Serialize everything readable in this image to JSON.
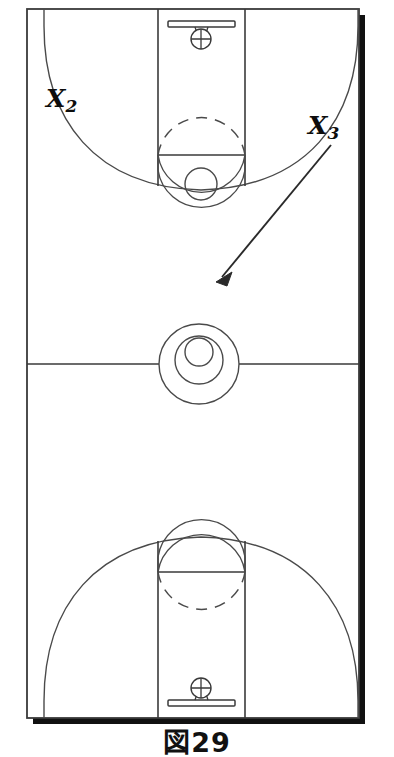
{
  "figure": {
    "caption": "図29",
    "background_color": "#ffffff",
    "line_color": "#3a3a3a",
    "shadow_color": "#111111",
    "label_color": "#0d0d0d"
  },
  "court": {
    "orientation": "vertical-full-court",
    "left": 27,
    "top": 9,
    "right": 359,
    "bottom": 718,
    "midline_y": 364,
    "shadow_offset": 6
  },
  "players": [
    {
      "id": "x2",
      "symbol": "X",
      "subscript": "2",
      "label": "X2",
      "x": 59,
      "y": 100,
      "role": "offensive-player-wing-left"
    },
    {
      "id": "x3",
      "symbol": "X",
      "subscript": "3",
      "label": "X3",
      "x": 320,
      "y": 128,
      "role": "offensive-player-wing-right"
    }
  ],
  "movements": [
    {
      "id": "cut-x3",
      "from_player": "X3",
      "type": "cut-arrow-straight",
      "start_x": 330,
      "start_y": 144,
      "end_x": 216,
      "end_y": 281,
      "description": "X3 cuts toward the middle of the court"
    }
  ],
  "baskets": [
    {
      "id": "top-basket",
      "position": "top",
      "backboard_y": 24,
      "rim_y": 37
    },
    {
      "id": "bottom-basket",
      "position": "bottom",
      "backboard_y": 703,
      "rim_y": 690
    }
  ],
  "center_circle": {
    "cx": 199,
    "cy": 364,
    "outer_r": 40,
    "middle_r": 24,
    "inner_r": 14,
    "inner_offset_y": -9
  },
  "markings": {
    "lane_left_x": 158,
    "lane_right_x": 245,
    "free_throw_line_top_y": 155,
    "free_throw_line_bottom_y": 572,
    "free_throw_circle_r": 44,
    "restricted_circle_r": 16,
    "three_point_arc_radius": 152
  }
}
